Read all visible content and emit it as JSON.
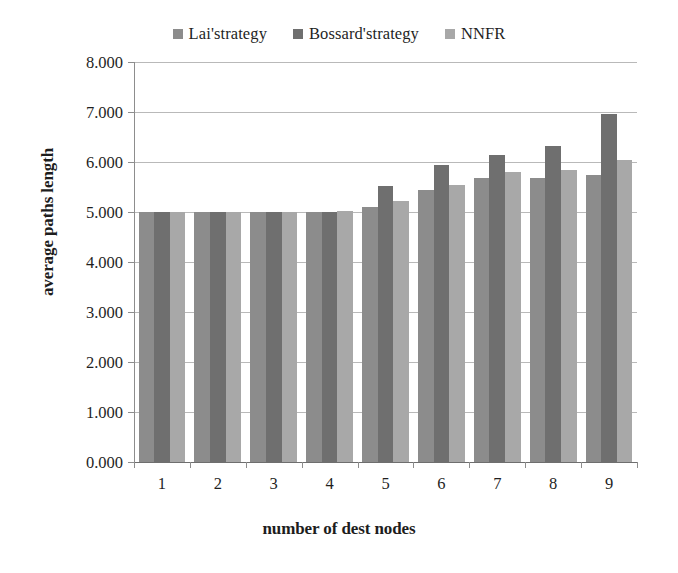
{
  "legend": {
    "position": "top-center",
    "entries": [
      {
        "label": "Lai'strategy",
        "color": "#8c8c8c"
      },
      {
        "label": "Bossard'strategy",
        "color": "#6f6f6f"
      },
      {
        "label": "NNFR",
        "color": "#a8a8a8"
      }
    ]
  },
  "axes": {
    "ylabel": "average paths length",
    "xlabel": "number of dest nodes",
    "ytick_labels": [
      "8.000",
      "7.000",
      "6.000",
      "5.000",
      "4.000",
      "3.000",
      "2.000",
      "1.000",
      "0.000"
    ],
    "xtick_labels": [
      "1",
      "2",
      "3",
      "4",
      "5",
      "6",
      "7",
      "8",
      "9"
    ]
  },
  "colors": {
    "series1": "#8c8c8c",
    "series2": "#6f6f6f",
    "series3": "#a8a8a8",
    "gridline": "#b9b9b9",
    "axis": "#8d8d8d",
    "text": "#1f1f1f",
    "background": "#ffffff"
  },
  "chart_data": {
    "type": "bar",
    "title": "",
    "xlabel": "number of dest nodes",
    "ylabel": "average paths length",
    "categories": [
      "1",
      "2",
      "3",
      "4",
      "5",
      "6",
      "7",
      "8",
      "9"
    ],
    "series": [
      {
        "name": "Lai'strategy",
        "values": [
          5.0,
          5.0,
          5.0,
          5.0,
          5.1,
          5.45,
          5.68,
          5.68,
          5.75
        ]
      },
      {
        "name": "Bossard'strategy",
        "values": [
          5.0,
          5.0,
          5.0,
          5.0,
          5.53,
          5.95,
          6.15,
          6.33,
          6.97
        ]
      },
      {
        "name": "NNFR",
        "values": [
          5.0,
          5.0,
          5.0,
          5.02,
          5.22,
          5.55,
          5.8,
          5.85,
          6.05
        ]
      }
    ],
    "ylim": [
      0,
      8
    ],
    "ytick_step": 1,
    "grid": true,
    "legend_position": "top"
  }
}
